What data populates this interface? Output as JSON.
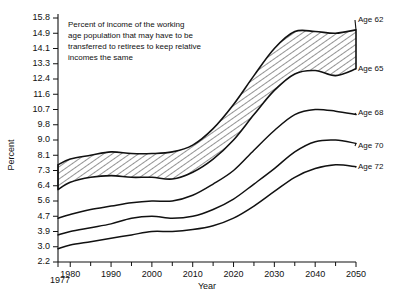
{
  "chart_data": {
    "type": "line",
    "title": "",
    "annotation": [
      "Percent of income of the working",
      "age population that may have to be",
      "transferred to retirees to keep relative",
      "incomes the same"
    ],
    "xlabel": "Year",
    "ylabel": "Percent",
    "grid": false,
    "legend_position": "right-inline",
    "xlim": [
      1977,
      2050
    ],
    "ylim": [
      2.2,
      15.8
    ],
    "x_tick_labels": [
      "1980",
      "1990",
      "2000",
      "2010",
      "2020",
      "2030",
      "2040",
      "2050"
    ],
    "x_ticks": [
      1980,
      1990,
      2000,
      2010,
      2020,
      2030,
      2040,
      2050
    ],
    "x_minor_ticks": [
      1985,
      1995,
      2005,
      2015,
      2025,
      2035,
      2045
    ],
    "x_origin_label": "1977",
    "y_tick_labels": [
      "15.8",
      "14.9",
      "14.1",
      "13.3",
      "12.4",
      "11.6",
      "10.7",
      "9.8",
      "9.0",
      "8.1",
      "7.3",
      "6.4",
      "5.6",
      "4.7",
      "3.9",
      "3.0",
      "2.2"
    ],
    "y_ticks": [
      15.8,
      14.9,
      14.1,
      13.3,
      12.4,
      11.6,
      10.7,
      9.8,
      9.0,
      8.1,
      7.3,
      6.4,
      5.6,
      4.7,
      3.9,
      3.0,
      2.2
    ],
    "shaded_band": {
      "between": [
        "Age 62",
        "Age 65"
      ],
      "style": "diagonal-hatch"
    },
    "x": [
      1977,
      1980,
      1985,
      1990,
      1995,
      2000,
      2005,
      2010,
      2015,
      2020,
      2025,
      2030,
      2035,
      2040,
      2045,
      2050
    ],
    "series": [
      {
        "name": "Age 62",
        "label": "Age 62",
        "values": [
          7.6,
          7.9,
          8.1,
          8.3,
          8.2,
          8.2,
          8.3,
          8.7,
          9.6,
          11.0,
          12.6,
          14.1,
          15.0,
          15.0,
          14.9,
          15.1
        ]
      },
      {
        "name": "Age 65",
        "label": "Age 65",
        "values": [
          6.2,
          6.6,
          6.9,
          7.0,
          6.9,
          6.9,
          6.8,
          7.2,
          7.9,
          9.0,
          10.4,
          11.8,
          12.7,
          12.9,
          12.6,
          13.0
        ]
      },
      {
        "name": "Age 68",
        "label": "Age 68",
        "values": [
          4.6,
          4.8,
          5.1,
          5.3,
          5.5,
          5.6,
          5.6,
          5.9,
          6.5,
          7.3,
          8.4,
          9.5,
          10.4,
          10.7,
          10.6,
          10.4
        ]
      },
      {
        "name": "Age 70",
        "label": "Age 70",
        "values": [
          3.7,
          3.9,
          4.1,
          4.3,
          4.6,
          4.7,
          4.6,
          4.7,
          5.1,
          5.7,
          6.5,
          7.4,
          8.3,
          8.9,
          9.0,
          8.8
        ]
      },
      {
        "name": "Age 72",
        "label": "Age 72",
        "values": [
          2.9,
          3.1,
          3.3,
          3.5,
          3.7,
          3.9,
          3.9,
          4.0,
          4.2,
          4.6,
          5.3,
          6.1,
          6.9,
          7.4,
          7.6,
          7.5
        ]
      }
    ]
  }
}
